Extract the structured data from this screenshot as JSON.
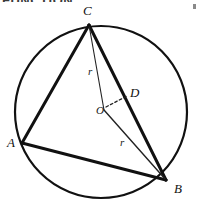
{
  "figure": {
    "width": 203,
    "height": 211,
    "background_color": "#ffffff",
    "stroke_color": "#111111",
    "artifacts": {
      "top_text_fragment": "FUNCTION",
      "corner_mark_name": "page-speck"
    },
    "circle": {
      "center": {
        "x": 101,
        "y": 112
      },
      "radius": 86,
      "stroke_width": 2.2,
      "color": "#111111"
    },
    "points": [
      {
        "id": "C",
        "label": "C",
        "x": 89,
        "y": 25,
        "on_circle": true
      },
      {
        "id": "A",
        "label": "A",
        "x": 22,
        "y": 143,
        "on_circle": true
      },
      {
        "id": "B",
        "label": "B",
        "x": 166,
        "y": 180,
        "on_circle": true
      },
      {
        "id": "O",
        "label": "O",
        "x": 104,
        "y": 110,
        "on_circle": false
      },
      {
        "id": "D",
        "label": "D",
        "x": 128,
        "y": 97,
        "on_circle": false
      }
    ],
    "segments": [
      {
        "id": "CA",
        "from": "C",
        "to": "A",
        "style": "solid",
        "weight": "thick",
        "width": 3.0
      },
      {
        "id": "CB",
        "from": "C",
        "to": "B",
        "style": "solid",
        "weight": "thick",
        "width": 3.0
      },
      {
        "id": "AB",
        "from": "A",
        "to": "B",
        "style": "solid",
        "weight": "thick",
        "width": 3.0
      },
      {
        "id": "CO",
        "from": "C",
        "to": "O",
        "style": "solid",
        "weight": "thin",
        "width": 1.1,
        "label": "r"
      },
      {
        "id": "OB",
        "from": "O",
        "to": "B",
        "style": "solid",
        "weight": "thin",
        "width": 1.3,
        "label": "r"
      },
      {
        "id": "OD",
        "from": "O",
        "to": "D",
        "style": "dashed",
        "weight": "thin",
        "width": 1.2
      }
    ],
    "labels": {
      "C": "C",
      "A": "A",
      "B": "B",
      "O": "O",
      "D": "D",
      "radius_top": "r",
      "radius_bottom": "r"
    }
  }
}
